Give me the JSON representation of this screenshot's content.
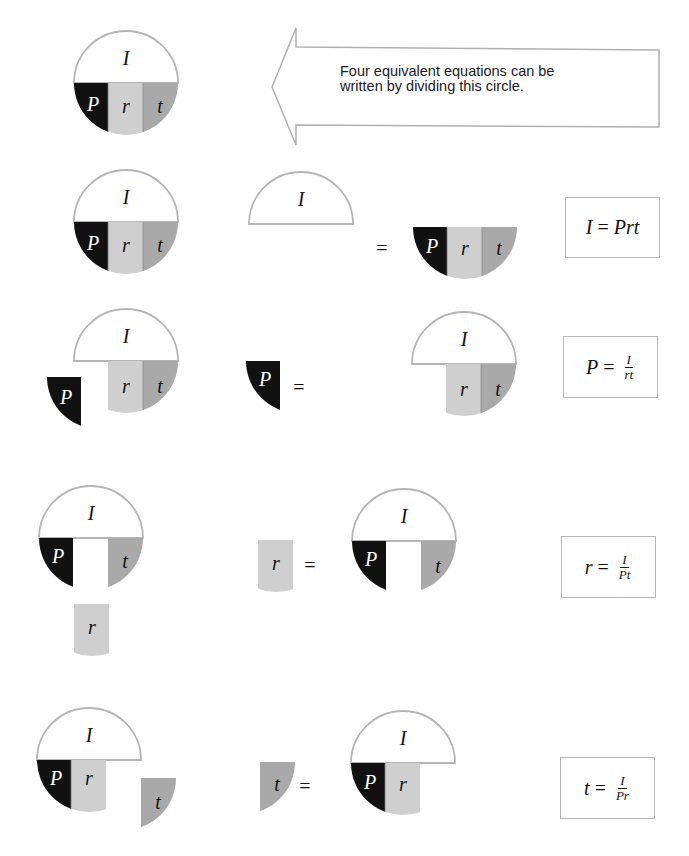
{
  "colors": {
    "P": "#111111",
    "r": "#cfcfcf",
    "t": "#a9a9a9",
    "I": "#ffffff",
    "outline": "#b5b5b5"
  },
  "variables": {
    "I": "I",
    "P": "P",
    "r": "r",
    "t": "t"
  },
  "callout": {
    "text": "Four equivalent equations can be written by dividing this circle."
  },
  "equals_sign": "=",
  "rows": [
    {
      "id": "I",
      "formula": {
        "lhs": "I",
        "eq": "=",
        "rhs": "Prt",
        "numerator": "",
        "denominator": ""
      }
    },
    {
      "id": "P",
      "formula": {
        "lhs": "P",
        "eq": "=",
        "rhs": "",
        "numerator": "I",
        "denominator": "rt"
      }
    },
    {
      "id": "r",
      "formula": {
        "lhs": "r",
        "eq": "=",
        "rhs": "",
        "numerator": "I",
        "denominator": "Pt"
      }
    },
    {
      "id": "t",
      "formula": {
        "lhs": "t",
        "eq": "=",
        "rhs": "",
        "numerator": "I",
        "denominator": "Pr"
      }
    }
  ]
}
